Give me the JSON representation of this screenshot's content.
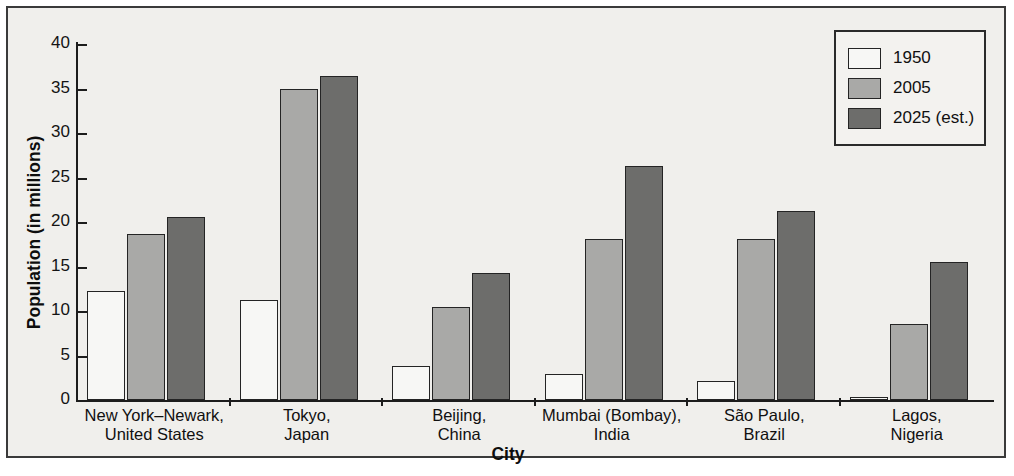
{
  "chart_data": {
    "type": "bar",
    "title": "",
    "xlabel": "City",
    "ylabel": "Population (in millions)",
    "ylim": [
      0,
      40
    ],
    "yticks": [
      0,
      5,
      10,
      15,
      20,
      25,
      30,
      35,
      40
    ],
    "grid": false,
    "legend_position": "top-right",
    "categories": [
      "New York–Newark,\nUnited States",
      "Tokyo,\nJapan",
      "Beijing,\nChina",
      "Mumbai (Bombay),\nIndia",
      "São Paulo,\nBrazil",
      "Lagos,\nNigeria"
    ],
    "series": [
      {
        "name": "1950",
        "color": "#f7f7f5",
        "values": [
          12.3,
          11.2,
          3.8,
          2.9,
          2.1,
          0.3
        ]
      },
      {
        "name": "2005",
        "color": "#a9a9a7",
        "values": [
          18.7,
          35.0,
          10.5,
          18.1,
          18.1,
          8.5
        ]
      },
      {
        "name": "2025 (est.)",
        "color": "#6d6d6b",
        "values": [
          20.6,
          36.4,
          14.3,
          26.3,
          21.2,
          15.5
        ]
      }
    ]
  },
  "legend": {
    "items": [
      {
        "label": "1950"
      },
      {
        "label": "2005"
      },
      {
        "label": "2025 (est.)"
      }
    ]
  },
  "axes": {
    "y_label": "Population (in millions)",
    "x_label": "City",
    "y_tick_labels": [
      "0",
      "5",
      "10",
      "15",
      "20",
      "25",
      "30",
      "35",
      "40"
    ]
  }
}
